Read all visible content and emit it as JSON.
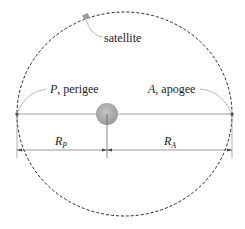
{
  "diagram": {
    "type": "elliptical-orbit",
    "labels": {
      "satellite": "satellite",
      "perigee_symbol": "P",
      "perigee_text": ", perigee",
      "apogee_symbol": "A",
      "apogee_text": ", apogee",
      "rp_main": "R",
      "rp_sub": "P",
      "ra_main": "R",
      "ra_sub": "A"
    },
    "colors": {
      "orbit": "#222222",
      "axis": "#777777",
      "earth": "#a8a8a8",
      "leader": "#888888"
    }
  }
}
